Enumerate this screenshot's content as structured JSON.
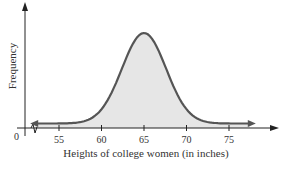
{
  "chart_data": {
    "type": "area",
    "title": "",
    "xlabel": "Heights of college women (in inches)",
    "ylabel": "Frequency",
    "x_ticks": [
      55,
      60,
      65,
      70,
      75
    ],
    "x_tick_labels": [
      "55",
      "60",
      "65",
      "70",
      "75"
    ],
    "origin_label": "0",
    "axis_break": true,
    "grid": false,
    "legend": null,
    "distribution": "normal",
    "mean": 65,
    "std_dev": 2.6,
    "xlim": [
      50,
      80
    ],
    "series": [
      {
        "name": "Frequency",
        "x": [
          52,
          55,
          57,
          59,
          60,
          61,
          62,
          63,
          64,
          65,
          66,
          67,
          68,
          69,
          70,
          71,
          73,
          75,
          78
        ],
        "values": [
          0.01,
          0.03,
          0.06,
          0.15,
          0.25,
          0.39,
          0.55,
          0.74,
          0.93,
          1.0,
          0.93,
          0.74,
          0.55,
          0.39,
          0.25,
          0.15,
          0.06,
          0.03,
          0.01
        ]
      }
    ],
    "colors": {
      "curve": "#555555",
      "fill": "#e6e6e6",
      "axis": "#222222"
    }
  }
}
